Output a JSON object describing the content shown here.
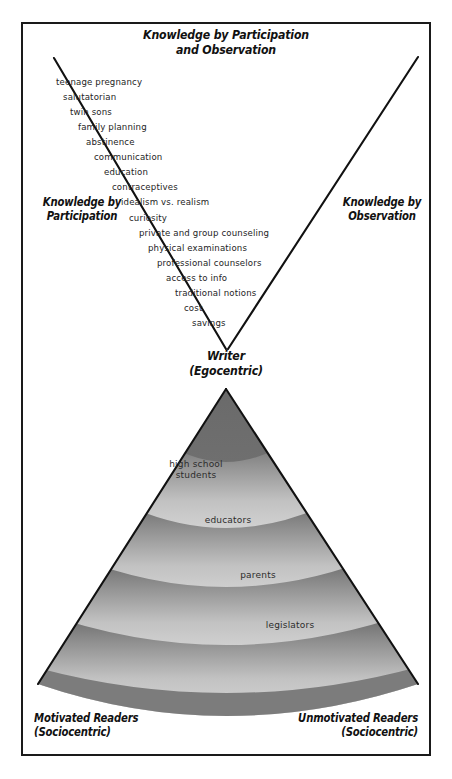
{
  "figure": {
    "title_line1": "Knowledge by Participation",
    "title_line2": "and Observation",
    "left_axis_label_line1": "Knowledge by",
    "left_axis_label_line2": "Participation",
    "right_axis_label_line1": "Knowledge by",
    "right_axis_label_line2": "Observation",
    "center_label_line1": "Writer",
    "center_label_line2": "(Egocentric)",
    "bottom_left_label_line1": "Motivated Readers",
    "bottom_left_label_line2": "(Sociocentric)",
    "bottom_right_label_line1": "Unmotivated Readers",
    "bottom_right_label_line2": "(Sociocentric)"
  },
  "concepts": [
    {
      "text": "teenage pregnancy",
      "x": 56,
      "y": 0
    },
    {
      "text": "salutatorian",
      "x": 63,
      "y": 15
    },
    {
      "text": "twin sons",
      "x": 70,
      "y": 30
    },
    {
      "text": "family planning",
      "x": 78,
      "y": 45
    },
    {
      "text": "abstinence",
      "x": 86,
      "y": 60
    },
    {
      "text": "communication",
      "x": 94,
      "y": 75
    },
    {
      "text": "education",
      "x": 104,
      "y": 90
    },
    {
      "text": "contraceptives",
      "x": 112,
      "y": 105
    },
    {
      "text": "idealism vs. realism",
      "x": 121,
      "y": 120
    },
    {
      "text": "curiosity",
      "x": 129,
      "y": 136
    },
    {
      "text": "private and group counseling",
      "x": 139,
      "y": 151
    },
    {
      "text": "physical examinations",
      "x": 148,
      "y": 166
    },
    {
      "text": "professional counselors",
      "x": 157,
      "y": 181
    },
    {
      "text": "access to info",
      "x": 166,
      "y": 196
    },
    {
      "text": "traditional notions",
      "x": 175,
      "y": 211
    },
    {
      "text": "cost",
      "x": 184,
      "y": 226
    },
    {
      "text": "savings",
      "x": 192,
      "y": 241
    }
  ],
  "audience_bands": [
    {
      "label_line1": "high school",
      "label_line2": "students",
      "x": 196,
      "y": 459
    },
    {
      "label_line1": "educators",
      "label_line2": "",
      "x": 228,
      "y": 515
    },
    {
      "label_line1": "parents",
      "label_line2": "",
      "x": 258,
      "y": 570
    },
    {
      "label_line1": "legislators",
      "label_line2": "",
      "x": 290,
      "y": 620
    }
  ],
  "colors": {
    "frame_stroke": "#1a1a1a",
    "line_stroke": "#111111",
    "band_dark": "#6f6f6f",
    "band_light": "#e4e4e4",
    "text": "#242424",
    "background": "#ffffff"
  },
  "geometry": {
    "v_left_top_x": 54,
    "v_left_top_y": 58,
    "v_right_top_x": 418,
    "v_right_top_y": 57,
    "v_vertex_x": 226,
    "v_vertex_y": 348,
    "cone_apex_x": 226,
    "cone_apex_y": 390,
    "cone_left_x": 38,
    "cone_right_x": 418,
    "cone_base_y": 684
  }
}
